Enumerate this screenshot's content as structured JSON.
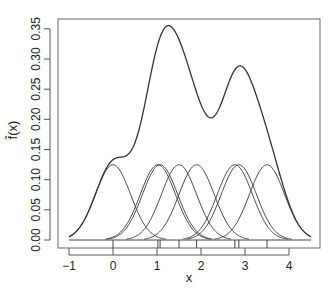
{
  "chart_data": {
    "type": "line",
    "title": "",
    "xlabel": "x",
    "ylabel": "f̂(x)",
    "xlim": [
      -1.25,
      4.75
    ],
    "ylim": [
      0,
      0.36
    ],
    "x_ticks": [
      -1,
      0,
      1,
      2,
      3,
      4
    ],
    "x_tick_labels": [
      "−1",
      "0",
      "1",
      "2",
      "3",
      "4"
    ],
    "y_ticks": [
      0.0,
      0.05,
      0.1,
      0.15,
      0.2,
      0.25,
      0.3,
      0.35
    ],
    "y_tick_labels": [
      "0.00",
      "0.05",
      "0.10",
      "0.15",
      "0.20",
      "0.25",
      "0.30",
      "0.35"
    ],
    "grid": false,
    "legend": null,
    "kernel": "gaussian",
    "bandwidth": 0.4,
    "sample_points": [
      0.0,
      1.02,
      1.07,
      1.5,
      1.9,
      2.77,
      2.86,
      3.5
    ],
    "curve_range": [
      -1.0,
      4.5
    ],
    "series": [
      {
        "name": "kernel density estimate",
        "description": "sum of the 8 scaled Gaussian kernels",
        "features": {
          "shoulder": {
            "x": 0.0,
            "y": 0.135
          },
          "peak1": {
            "x": 1.3,
            "y": 0.355
          },
          "trough": {
            "x": 2.23,
            "y": 0.19
          },
          "peak2": {
            "x": 2.93,
            "y": 0.29
          }
        }
      },
      {
        "name": "individual kernels",
        "description": "8 Gaussian bumps of height ~0.125 centered at sample points",
        "peak_height": 0.125
      }
    ],
    "rug": [
      0.0,
      1.02,
      1.07,
      1.5,
      1.9,
      2.77,
      2.86,
      3.5
    ],
    "colors": {
      "line": "#333333",
      "axis": "#555555",
      "text": "#222222",
      "background": "#ffffff"
    }
  }
}
